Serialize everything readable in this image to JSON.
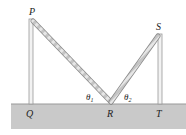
{
  "diagram": {
    "points": {
      "P": "P",
      "Q": "Q",
      "R": "R",
      "S": "S",
      "T": "T"
    },
    "angles": {
      "theta1": "θ",
      "theta1_sub": "1",
      "theta2": "θ",
      "theta2_sub": "2"
    },
    "colors": {
      "ground": "#c8c8c8",
      "rope": "#b8b8b8",
      "pole": "#e8e8e8",
      "pole_stroke": "#9a9a9a"
    }
  }
}
